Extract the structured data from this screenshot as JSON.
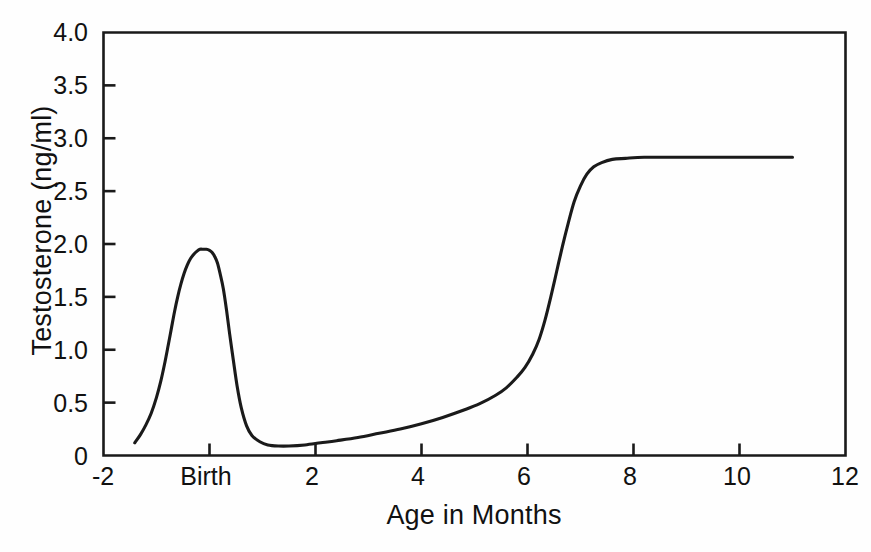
{
  "chart_data": {
    "type": "line",
    "title": "",
    "xlabel": "Age in Months",
    "ylabel": "Testosterone (ng/ml)",
    "xlim": [
      -2,
      12
    ],
    "ylim": [
      0,
      4.0
    ],
    "grid": false,
    "legend": "none",
    "line_color": "#1a1a1a",
    "axis_color": "#1a1a1a",
    "background_color": "#ffffff",
    "xticks": [
      -2,
      0,
      2,
      4,
      6,
      8,
      10,
      12
    ],
    "xtick_labels": [
      "-2",
      "Birth",
      "2",
      "4",
      "6",
      "8",
      "10",
      "12"
    ],
    "yticks": [
      0,
      0.5,
      1.0,
      1.5,
      2.0,
      2.5,
      3.0,
      3.5,
      4.0
    ],
    "ytick_labels": [
      "0",
      "0.5",
      "1.0",
      "1.5",
      "2.0",
      "2.5",
      "3.0",
      "3.5",
      "4.0"
    ],
    "series": [
      {
        "name": "Testosterone",
        "x": [
          -1.41,
          -1.3,
          -1.2,
          -1.1,
          -1.0,
          -0.92,
          -0.85,
          -0.78,
          -0.72,
          -0.66,
          -0.6,
          -0.54,
          -0.48,
          -0.42,
          -0.36,
          -0.3,
          -0.24,
          -0.18,
          -0.12,
          -0.06,
          0.0,
          0.05,
          0.1,
          0.15,
          0.2,
          0.26,
          0.32,
          0.38,
          0.45,
          0.52,
          0.6,
          0.7,
          0.8,
          0.95,
          1.1,
          1.3,
          1.5,
          1.8,
          2.1,
          2.4,
          2.8,
          3.2,
          3.6,
          4.0,
          4.4,
          4.8,
          5.1,
          5.4,
          5.6,
          5.8,
          5.95,
          6.1,
          6.22,
          6.33,
          6.44,
          6.55,
          6.66,
          6.77,
          6.88,
          7.0,
          7.12,
          7.25,
          7.4,
          7.6,
          7.85,
          8.2,
          8.7,
          9.3,
          10.0,
          10.5,
          11.0
        ],
        "y": [
          0.12,
          0.2,
          0.29,
          0.4,
          0.55,
          0.7,
          0.86,
          1.04,
          1.2,
          1.36,
          1.5,
          1.62,
          1.72,
          1.8,
          1.86,
          1.9,
          1.93,
          1.95,
          1.95,
          1.95,
          1.94,
          1.92,
          1.88,
          1.82,
          1.72,
          1.58,
          1.38,
          1.15,
          0.9,
          0.66,
          0.45,
          0.28,
          0.19,
          0.13,
          0.1,
          0.09,
          0.09,
          0.1,
          0.12,
          0.14,
          0.17,
          0.21,
          0.25,
          0.3,
          0.36,
          0.43,
          0.49,
          0.57,
          0.64,
          0.74,
          0.83,
          0.96,
          1.1,
          1.28,
          1.5,
          1.74,
          1.98,
          2.2,
          2.4,
          2.55,
          2.66,
          2.73,
          2.77,
          2.8,
          2.81,
          2.82,
          2.82,
          2.82,
          2.82,
          2.82,
          2.82
        ]
      }
    ],
    "annotations": [
      {
        "text": "Birth",
        "x": 0,
        "note": "x-axis tick label at month 0"
      }
    ]
  }
}
